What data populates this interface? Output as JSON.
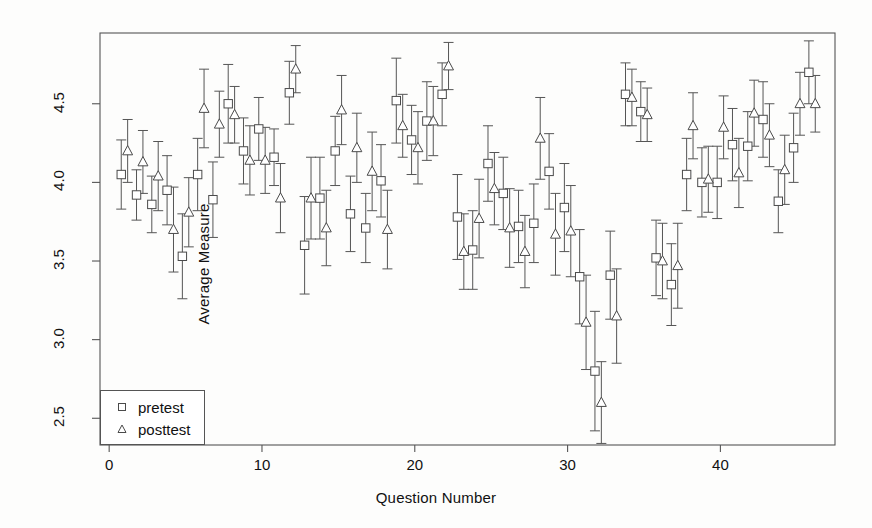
{
  "chart_data": {
    "type": "scatter",
    "title": "",
    "xlabel": "Question Number",
    "ylabel": "Average Measure",
    "xlim": [
      -0.6,
      47.5
    ],
    "ylim": [
      2.33,
      4.95
    ],
    "xticks": [
      0,
      10,
      20,
      30,
      40
    ],
    "ytick_values": [
      2.5,
      3.0,
      3.5,
      4.0,
      4.5
    ],
    "ytick_labels": [
      "2.5",
      "3.0",
      "3.5",
      "4.0",
      "4.5"
    ],
    "grid": false,
    "frame": true,
    "legend_position": "bottom-left",
    "error_bars": "vertical, capped (±1 SE)",
    "marker_color": "#4a4a4a",
    "axis_color": "#555555",
    "series": [
      {
        "name": "pretest",
        "marker": "square",
        "x": [
          1,
          2,
          3,
          4,
          5,
          6,
          7,
          8,
          9,
          10,
          11,
          12,
          13,
          14,
          15,
          16,
          17,
          18,
          19,
          20,
          21,
          22,
          23,
          24,
          25,
          26,
          27,
          28,
          29,
          30,
          31,
          32,
          33,
          34,
          35,
          36,
          37,
          38,
          39,
          40,
          41,
          42,
          43,
          44,
          45,
          46
        ],
        "values": [
          4.05,
          3.92,
          3.86,
          3.95,
          3.53,
          4.05,
          3.89,
          4.5,
          4.2,
          4.34,
          4.16,
          4.57,
          3.6,
          3.9,
          4.2,
          3.8,
          3.71,
          4.01,
          4.52,
          4.27,
          4.39,
          4.56,
          3.78,
          3.57,
          4.12,
          3.93,
          3.72,
          3.74,
          4.07,
          3.84,
          3.4,
          2.8,
          3.41,
          4.56,
          4.45,
          3.52,
          3.35,
          4.05,
          4.0,
          4.0,
          4.24,
          4.23,
          4.4,
          3.88,
          4.22,
          4.7
        ],
        "err_low": [
          0.22,
          0.16,
          0.18,
          0.22,
          0.27,
          0.23,
          0.24,
          0.25,
          0.21,
          0.2,
          0.18,
          0.2,
          0.31,
          0.26,
          0.22,
          0.24,
          0.22,
          0.23,
          0.27,
          0.22,
          0.25,
          0.2,
          0.27,
          0.25,
          0.24,
          0.23,
          0.23,
          0.25,
          0.24,
          0.28,
          0.3,
          0.38,
          0.28,
          0.2,
          0.19,
          0.24,
          0.26,
          0.23,
          0.22,
          0.23,
          0.23,
          0.22,
          0.24,
          0.2,
          0.22,
          0.2
        ],
        "err_high": [
          0.22,
          0.16,
          0.18,
          0.22,
          0.27,
          0.23,
          0.24,
          0.25,
          0.21,
          0.2,
          0.18,
          0.2,
          0.31,
          0.26,
          0.22,
          0.24,
          0.22,
          0.23,
          0.27,
          0.22,
          0.25,
          0.2,
          0.27,
          0.25,
          0.24,
          0.23,
          0.23,
          0.25,
          0.24,
          0.28,
          0.3,
          0.38,
          0.28,
          0.2,
          0.19,
          0.24,
          0.26,
          0.23,
          0.22,
          0.23,
          0.23,
          0.22,
          0.24,
          0.2,
          0.22,
          0.2
        ]
      },
      {
        "name": "posttest",
        "marker": "triangle",
        "x": [
          1,
          2,
          3,
          4,
          5,
          6,
          7,
          8,
          9,
          10,
          11,
          12,
          13,
          14,
          15,
          16,
          17,
          18,
          19,
          20,
          21,
          22,
          23,
          24,
          25,
          26,
          27,
          28,
          29,
          30,
          31,
          32,
          33,
          34,
          35,
          36,
          37,
          38,
          39,
          40,
          41,
          42,
          43,
          44,
          45,
          46
        ],
        "values": [
          4.2,
          4.13,
          4.04,
          3.7,
          3.81,
          4.47,
          4.37,
          4.43,
          4.14,
          4.14,
          3.9,
          4.72,
          3.9,
          3.71,
          4.46,
          4.22,
          4.07,
          3.7,
          4.36,
          4.22,
          4.39,
          4.74,
          3.56,
          3.77,
          3.96,
          3.71,
          3.56,
          4.28,
          3.67,
          3.69,
          3.11,
          2.6,
          3.15,
          4.54,
          4.43,
          3.5,
          3.47,
          4.36,
          4.02,
          4.35,
          4.06,
          4.44,
          4.3,
          4.08,
          4.5,
          4.5
        ],
        "err_low": [
          0.2,
          0.2,
          0.22,
          0.27,
          0.22,
          0.25,
          0.21,
          0.18,
          0.22,
          0.21,
          0.22,
          0.15,
          0.26,
          0.24,
          0.22,
          0.22,
          0.25,
          0.25,
          0.2,
          0.23,
          0.22,
          0.15,
          0.24,
          0.25,
          0.23,
          0.25,
          0.23,
          0.26,
          0.26,
          0.29,
          0.3,
          0.26,
          0.3,
          0.18,
          0.17,
          0.24,
          0.27,
          0.21,
          0.21,
          0.2,
          0.22,
          0.21,
          0.2,
          0.22,
          0.2,
          0.18
        ],
        "err_high": [
          0.2,
          0.2,
          0.22,
          0.27,
          0.22,
          0.25,
          0.21,
          0.18,
          0.22,
          0.21,
          0.22,
          0.15,
          0.26,
          0.24,
          0.22,
          0.22,
          0.25,
          0.25,
          0.2,
          0.23,
          0.22,
          0.15,
          0.24,
          0.25,
          0.23,
          0.25,
          0.23,
          0.26,
          0.26,
          0.29,
          0.3,
          0.26,
          0.3,
          0.18,
          0.17,
          0.24,
          0.27,
          0.21,
          0.21,
          0.2,
          0.22,
          0.21,
          0.2,
          0.22,
          0.2,
          0.18
        ]
      }
    ]
  },
  "legend": {
    "items": [
      {
        "label": "pretest",
        "marker": "square"
      },
      {
        "label": "posttest",
        "marker": "triangle"
      }
    ]
  }
}
